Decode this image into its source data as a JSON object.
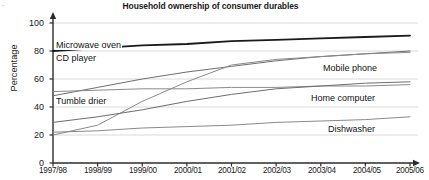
{
  "chart_data": {
    "type": "line",
    "title": "Household ownership of consumer durables",
    "xlabel": "",
    "ylabel": "Percentage",
    "categories": [
      "1997/98",
      "1998/99",
      "1999/00",
      "2000/01",
      "2001/02",
      "2002/03",
      "2003/04",
      "2004/05",
      "2005/06"
    ],
    "ylim": [
      0,
      100
    ],
    "yticks": [
      "0",
      "20",
      "40",
      "60",
      "80",
      "100"
    ],
    "grid": true,
    "legend_position": "inline-labels",
    "series": [
      {
        "name": "Microwave oven",
        "label_side": "left",
        "color": "#1a1a1a",
        "width": 1.8,
        "values": [
          80,
          82,
          84,
          85,
          87,
          88,
          89,
          90,
          91
        ]
      },
      {
        "name": "CD player",
        "label_side": "left",
        "color": "#6e6e6e",
        "width": 1.0,
        "values": [
          48,
          54,
          60,
          65,
          69,
          73,
          76,
          78,
          80
        ]
      },
      {
        "name": "Tumble drier",
        "label_side": "left",
        "color": "#8a8a8a",
        "width": 1.0,
        "values": [
          51,
          52,
          53,
          53,
          54,
          54,
          55,
          55,
          56
        ]
      },
      {
        "name": "Mobile phone",
        "label_side": "right",
        "color": "#8a8a8a",
        "width": 1.0,
        "values": [
          20,
          27,
          44,
          58,
          70,
          74,
          76,
          78,
          79
        ]
      },
      {
        "name": "Home computer",
        "label_side": "right",
        "color": "#6e6e6e",
        "width": 1.0,
        "values": [
          29,
          33,
          38,
          44,
          49,
          53,
          55,
          57,
          58
        ]
      },
      {
        "name": "Dishwasher",
        "label_side": "right",
        "color": "#8a8a8a",
        "width": 1.0,
        "values": [
          22,
          23,
          25,
          26,
          27,
          29,
          30,
          31,
          33
        ]
      }
    ]
  },
  "colors": {
    "axis": "#2b2b2b",
    "grid": "#d9d9d9",
    "text": "#1a1a1a",
    "background": "#ffffff"
  },
  "labels": {
    "microwave_oven": "Microwave oven",
    "cd_player": "CD player",
    "tumble_drier": "Tumble drier",
    "mobile_phone": "Mobile phone",
    "home_computer": "Home computer",
    "dishwasher": "Dishwasher"
  },
  "corner_mark": "·"
}
